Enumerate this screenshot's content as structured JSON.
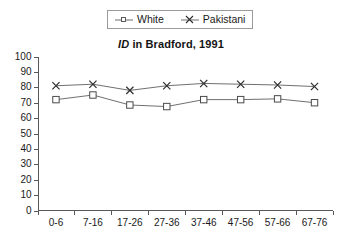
{
  "chart_data": {
    "type": "line",
    "title": "ID in Bradford, 1991",
    "title_italic_prefix": "ID",
    "title_rest": " in Bradford, 1991",
    "xlabel": "",
    "ylabel": "",
    "ylim": [
      0,
      100
    ],
    "ytick_step": 10,
    "yticks": [
      "0",
      "10",
      "20",
      "30",
      "40",
      "50",
      "60",
      "70",
      "80",
      "90",
      "100"
    ],
    "grid": false,
    "legend_position": "top-center",
    "categories": [
      "0-6",
      "7-16",
      "17-26",
      "27-36",
      "37-46",
      "47-56",
      "57-66",
      "67-76"
    ],
    "series": [
      {
        "name": "White",
        "marker": "square",
        "values": [
          72,
          75,
          68.5,
          67.5,
          72,
          72,
          72.5,
          70
        ]
      },
      {
        "name": "Pakistani",
        "marker": "x",
        "values": [
          81,
          82,
          78,
          81,
          82.5,
          82,
          81.5,
          80.5
        ]
      }
    ]
  },
  "legend": {
    "items": [
      {
        "label": "White",
        "marker": "square-marker-icon"
      },
      {
        "label": "Pakistani",
        "marker": "x-marker-icon"
      }
    ]
  },
  "colors": {
    "line": "#707070",
    "axis": "#585858",
    "text": "#1a1a1a",
    "legend_border": "#9a9a9a",
    "background": "#ffffff"
  }
}
